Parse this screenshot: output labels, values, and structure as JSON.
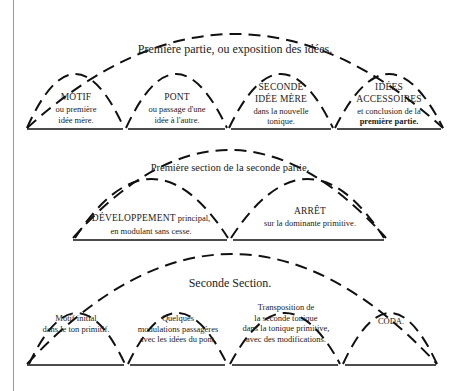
{
  "rows": [
    {
      "title": "Première partie, ou exposition des idées.",
      "cells": [
        {
          "head": "MOTIF",
          "lines": [
            "ou première",
            "idée mère."
          ]
        },
        {
          "head": "PONT",
          "lines": [
            "ou passage d'une",
            "idée à l'autre."
          ]
        },
        {
          "head": "SECONDE",
          "head2": "IDÉE MÈRE",
          "lines": [
            "dans la nouvelle",
            "tonique."
          ]
        },
        {
          "head": "IDÉES",
          "head2": "ACCESSOIRES",
          "lines": [
            "et conclusion de la"
          ],
          "bold_line": "première partie."
        }
      ]
    },
    {
      "title": "Première section de la seconde partie.",
      "cells": [
        {
          "head": "DÉVELOPPEMENT",
          "head_suffix": " principal,",
          "lines": [
            "en modulant sans cesse."
          ]
        },
        {
          "head": "ARRÊT",
          "lines": [
            "sur la dominante primitive."
          ]
        }
      ]
    },
    {
      "title": "Seconde Section.",
      "cells": [
        {
          "lines": [
            "Motif initial",
            "dans le ton primitif."
          ]
        },
        {
          "lines": [
            "Quelques",
            "modulations passagères",
            "avec les idées du pont."
          ]
        },
        {
          "lines": [
            "Transposition de",
            "la seconde tonique",
            "dans la tonique primitive,",
            "avec des modifications."
          ]
        },
        {
          "head": "CODA."
        }
      ]
    }
  ]
}
